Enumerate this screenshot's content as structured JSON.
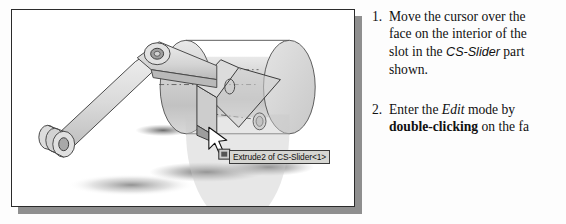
{
  "figure": {
    "name": "cad-assembly-screenshot",
    "caption_tooltip": "Extrude2 of CS-Slider<1>",
    "cursor_icon": "arrow-cursor-icon",
    "face_badge_icon": "face-select-badge-icon",
    "frame_border_color": "#2b2b2b",
    "frame_shadow_color": "#8f8f8f",
    "part_fill_color": "#d9d9d9",
    "highlight_face_color": "#cfcfcf",
    "background_color": "#ffffff",
    "model_parts": [
      "cs-slider-cylinder",
      "crank-link",
      "connecting-rod",
      "pin-joint-left",
      "pin-joint-right",
      "slot-face-highlight"
    ]
  },
  "steps": [
    {
      "number": "1.",
      "lines": [
        [
          {
            "t": "Move the cursor over the",
            "s": "normal"
          }
        ],
        [
          {
            "t": "face on the interior of the",
            "s": "normal"
          }
        ],
        [
          {
            "t": "slot in the ",
            "s": "normal"
          },
          {
            "t": "CS-Slider",
            "s": "italic-sans"
          },
          {
            "t": " part",
            "s": "normal"
          }
        ],
        [
          {
            "t": "shown.",
            "s": "normal"
          }
        ]
      ]
    },
    {
      "number": "2.",
      "lines": [
        [
          {
            "t": "Enter the ",
            "s": "normal"
          },
          {
            "t": "Edit",
            "s": "italic"
          },
          {
            "t": " mode by",
            "s": "normal"
          }
        ],
        [
          {
            "t": "double-clicking",
            "s": "bold"
          },
          {
            "t": " on the fa",
            "s": "normal"
          }
        ]
      ]
    }
  ]
}
